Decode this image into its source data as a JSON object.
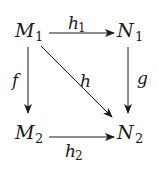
{
  "diagram": {
    "type": "commutative-square",
    "nodes": [
      {
        "id": "M1",
        "base": "M",
        "sub": "1",
        "x": 16,
        "y": 36
      },
      {
        "id": "N1",
        "base": "N",
        "sub": "1",
        "x": 118,
        "y": 36
      },
      {
        "id": "M2",
        "base": "M",
        "sub": "2",
        "x": 16,
        "y": 138
      },
      {
        "id": "N2",
        "base": "N",
        "sub": "2",
        "x": 118,
        "y": 138
      }
    ],
    "edges": [
      {
        "id": "h1",
        "from": "M1",
        "to": "N1",
        "label_base": "h",
        "label_sub": "1"
      },
      {
        "id": "f",
        "from": "M1",
        "to": "M2",
        "label_base": "f",
        "label_sub": ""
      },
      {
        "id": "h",
        "from": "M1",
        "to": "N2",
        "label_base": "h",
        "label_sub": ""
      },
      {
        "id": "g",
        "from": "N1",
        "to": "N2",
        "label_base": "g",
        "label_sub": ""
      },
      {
        "id": "h2",
        "from": "M2",
        "to": "N2",
        "label_base": "h",
        "label_sub": "2"
      }
    ],
    "colors": {
      "stroke": "#1a1a1a",
      "background": "#ffffff"
    }
  }
}
